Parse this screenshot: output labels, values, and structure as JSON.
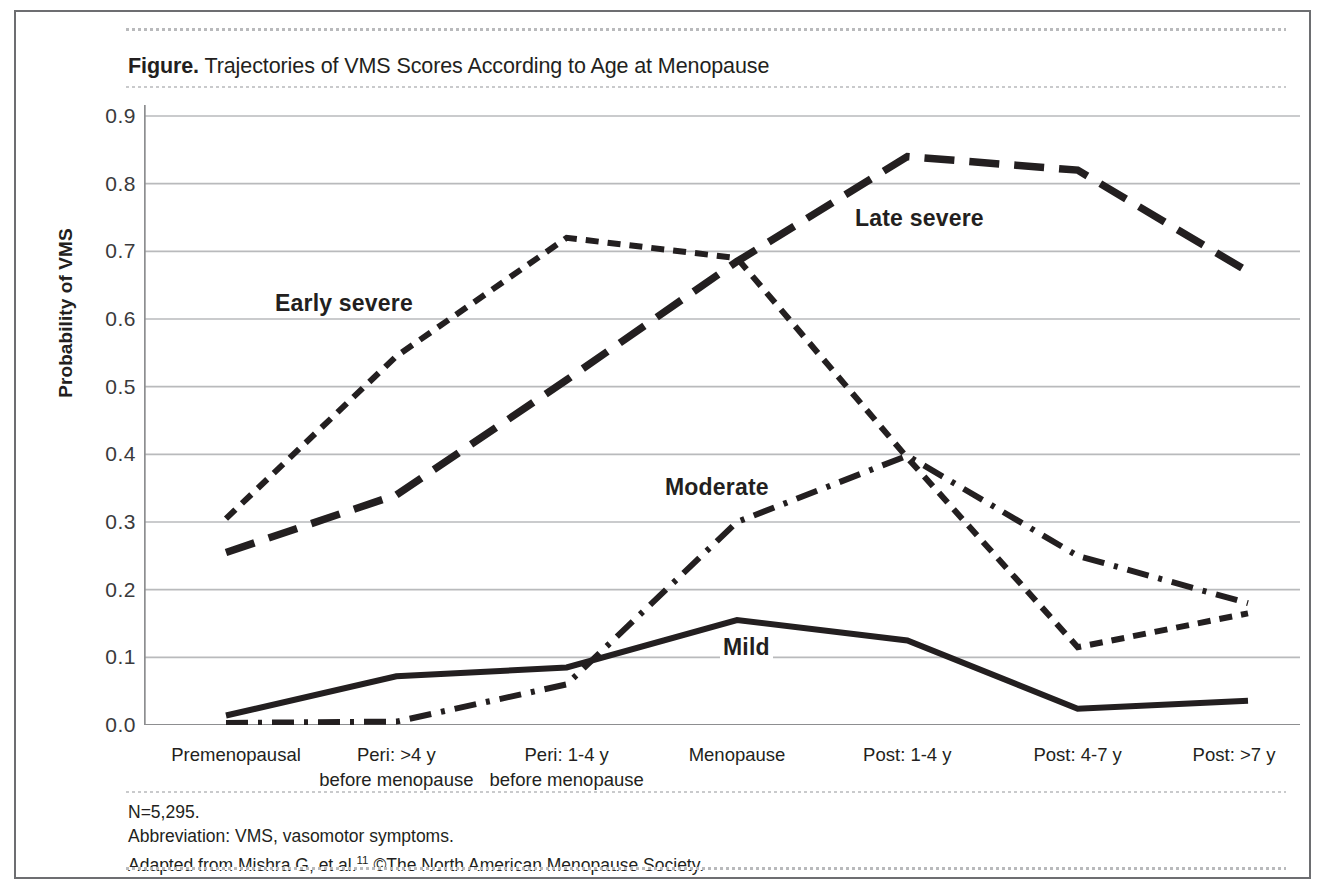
{
  "figure": {
    "label": "Figure.",
    "title": " Trajectories of VMS Scores According to Age at Menopause"
  },
  "axes": {
    "y_title": "Probability of VMS",
    "y_ticks": [
      "0.9",
      "0.8",
      "0.7",
      "0.6",
      "0.5",
      "0.4",
      "0.3",
      "0.2",
      "0.1",
      "0.0"
    ],
    "x_ticks": [
      "Premenopausal",
      "Peri: >4 y\nbefore menopause",
      "Peri: 1-4 y\nbefore menopause",
      "Menopause",
      "Post: 1-4 y",
      "Post: 4-7 y",
      "Post: >7 y"
    ]
  },
  "series_labels": {
    "early_severe": "Early severe",
    "late_severe": "Late severe",
    "moderate": "Moderate",
    "mild": "Mild"
  },
  "footnotes": {
    "n": "N=5,295.",
    "abbreviation": "Abbreviation: VMS, vasomotor symptoms.",
    "source_pre": "Adapted from Mishra G, et al.",
    "source_sup": "11",
    "source_post": " ©The North American Menopause Society."
  },
  "colors": {
    "line": "#231f20",
    "grid": "#b9babc",
    "frame": "#6d6e71",
    "background": "#ffffff"
  },
  "chart_data": {
    "type": "line",
    "title": "Trajectories of VMS Scores According to Age at Menopause",
    "xlabel": "",
    "ylabel": "Probability of VMS",
    "ylim": [
      0.0,
      0.9
    ],
    "grid": true,
    "legend": "in-plot labels",
    "categories": [
      "Premenopausal",
      "Peri: >4 y before menopause",
      "Peri: 1-4 y before menopause",
      "Menopause",
      "Post: 1-4 y",
      "Post: 4-7 y",
      "Post: >7 y"
    ],
    "series": [
      {
        "name": "Early severe",
        "dash": "short-dash",
        "values": [
          0.305,
          0.545,
          0.72,
          0.69,
          0.395,
          0.115,
          0.165
        ]
      },
      {
        "name": "Late severe",
        "dash": "long-dash",
        "values": [
          0.255,
          0.34,
          0.51,
          0.685,
          0.84,
          0.82,
          0.67
        ]
      },
      {
        "name": "Moderate",
        "dash": "dash-dot",
        "values": [
          0.003,
          0.005,
          0.06,
          0.3,
          0.398,
          0.25,
          0.18
        ]
      },
      {
        "name": "Mild",
        "dash": "solid",
        "values": [
          0.014,
          0.072,
          0.085,
          0.155,
          0.125,
          0.024,
          0.036
        ]
      }
    ]
  }
}
